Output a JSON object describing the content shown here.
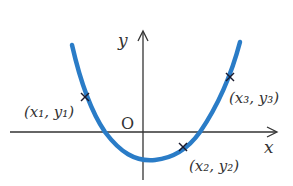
{
  "diagram": {
    "type": "parabola-with-points",
    "axes": {
      "x_label": "x",
      "y_label": "y",
      "origin_label": "O"
    },
    "curve": {
      "color": "#2a7cc7",
      "shape": "upward parabola"
    },
    "points": [
      {
        "label": "(x₁, y₁)",
        "name": "point-1"
      },
      {
        "label": "(x₂, y₂)",
        "name": "point-2"
      },
      {
        "label": "(x₃, y₃)",
        "name": "point-3"
      }
    ],
    "colors": {
      "axis": "#333333",
      "curve": "#2a7cc7",
      "marker": "#1a1a2e"
    }
  }
}
